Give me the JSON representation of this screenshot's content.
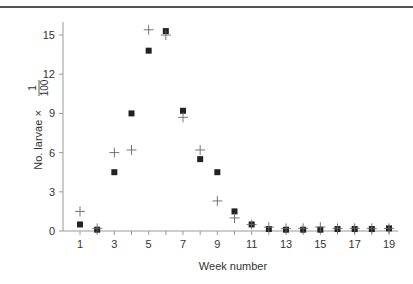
{
  "chart_data": {
    "type": "scatter",
    "title": "",
    "xlabel": "Week number",
    "ylabel": "No. larvae × 1/100",
    "ylabel_parts": {
      "main": "No. larvae ×",
      "frac_num": "1",
      "frac_den": "100"
    },
    "x": [
      1,
      2,
      3,
      4,
      5,
      6,
      7,
      8,
      9,
      10,
      11,
      12,
      13,
      14,
      15,
      16,
      17,
      18,
      19
    ],
    "xlim": [
      0.5,
      19.5
    ],
    "ylim": [
      0,
      16
    ],
    "x_ticks_labeled": [
      1,
      3,
      5,
      7,
      9,
      11,
      13,
      15,
      17,
      19
    ],
    "y_ticks": [
      0,
      3,
      6,
      9,
      12,
      15
    ],
    "grid": false,
    "legend": null,
    "series": [
      {
        "name": "squares",
        "marker": "filled-square",
        "values": [
          0.5,
          0.1,
          4.5,
          9.0,
          13.8,
          15.3,
          9.2,
          5.5,
          4.5,
          1.5,
          0.5,
          0.15,
          0.1,
          0.1,
          0.1,
          0.15,
          0.15,
          0.15,
          0.2
        ]
      },
      {
        "name": "crosses",
        "marker": "plus",
        "values": [
          1.5,
          0.2,
          6.0,
          6.2,
          15.4,
          15.0,
          8.7,
          6.2,
          2.3,
          1.0,
          0.5,
          0.3,
          0.2,
          0.2,
          0.3,
          0.2,
          0.2,
          0.2,
          0.2
        ]
      }
    ]
  },
  "colors": {
    "axis": "#999999",
    "marker": "#222222",
    "cross": "#666666",
    "text": "#333333"
  }
}
